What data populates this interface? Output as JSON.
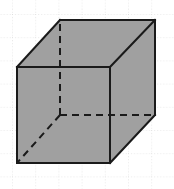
{
  "figure": {
    "width": 174,
    "height": 189,
    "background_color": "#ffffff"
  },
  "grid": {
    "label": "dotted graph paper grid",
    "line_color": "#d2d2d2",
    "line_width": 1,
    "dash_pattern": "1,2",
    "spacing_x": 23.2,
    "spacing_y": 23.2,
    "offset_x": 12,
    "offset_y": 14,
    "x_positions": [
      12,
      35,
      58,
      81,
      105,
      128,
      151,
      174
    ],
    "y_positions": [
      14,
      37,
      61,
      84,
      107,
      130,
      154,
      177
    ]
  },
  "chart_data": {
    "type": "diagram",
    "shape": "cube",
    "projection": "oblique",
    "fill_color": "#a0a0a0",
    "stroke_color": "#1a1a1a",
    "stroke_width": 2,
    "hidden_edge_dash": "7,5",
    "vertices": {
      "front_top_left": [
        17,
        67
      ],
      "front_top_right": [
        110,
        67
      ],
      "front_bottom_right": [
        110,
        163
      ],
      "front_bottom_left": [
        17,
        163
      ],
      "back_top_left": [
        60,
        20
      ],
      "back_top_right": [
        155,
        20
      ],
      "back_bottom_right": [
        155,
        115
      ],
      "back_bottom_left": [
        60,
        115
      ]
    },
    "visible_edges": [
      [
        "front_top_left",
        "front_top_right"
      ],
      [
        "front_top_right",
        "front_bottom_right"
      ],
      [
        "front_bottom_right",
        "front_bottom_left"
      ],
      [
        "front_bottom_left",
        "front_top_left"
      ],
      [
        "back_top_left",
        "back_top_right"
      ],
      [
        "back_top_right",
        "back_bottom_right"
      ],
      [
        "front_top_left",
        "back_top_left"
      ],
      [
        "front_top_right",
        "back_top_right"
      ],
      [
        "front_bottom_right",
        "back_bottom_right"
      ]
    ],
    "hidden_edges": [
      [
        "back_bottom_left",
        "back_top_left"
      ],
      [
        "back_bottom_left",
        "back_bottom_right"
      ],
      [
        "back_bottom_left",
        "front_bottom_left"
      ]
    ],
    "faces": [
      {
        "name": "top-face",
        "points": "17,67 60,20 155,20 110,67"
      },
      {
        "name": "front-face",
        "points": "17,67 110,67 110,163 17,163"
      },
      {
        "name": "right-face",
        "points": "110,67 155,20 155,115 110,163"
      }
    ]
  }
}
